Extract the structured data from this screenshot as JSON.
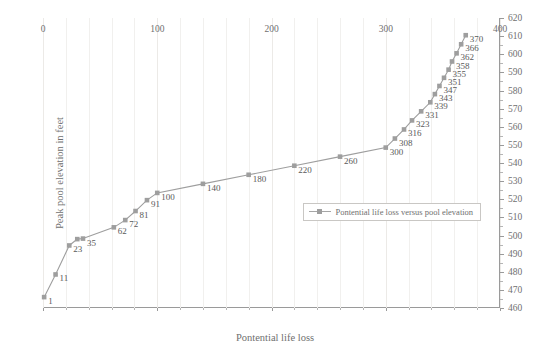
{
  "chart_data": {
    "type": "line",
    "title": "",
    "xlabel": "Pontential life loss",
    "ylabel": "Peak pool elevation in feet",
    "xlim": [
      0,
      400
    ],
    "ylim": [
      460,
      620
    ],
    "x_ticks": [
      0,
      100,
      200,
      300,
      400
    ],
    "y_ticks": [
      460,
      470,
      480,
      490,
      500,
      510,
      520,
      530,
      540,
      550,
      560,
      570,
      580,
      590,
      600,
      610,
      620
    ],
    "x_minor_step": 20,
    "y_minor_step": 5,
    "grid": "vertical",
    "y_axis_position": "right",
    "legend_position": "center-right",
    "series": [
      {
        "name": "Pontential life loss versus pool elevation",
        "color": "#9e9e9e",
        "marker": "square",
        "x": [
          1,
          11,
          23,
          30,
          35,
          62,
          72,
          81,
          91,
          100,
          140,
          180,
          220,
          260,
          300,
          308,
          316,
          323,
          331,
          339,
          343,
          347,
          351,
          355,
          358,
          362,
          366,
          370
        ],
        "y": [
          466.0,
          478.5,
          494.5,
          498.0,
          498.3,
          504.5,
          508.5,
          513.5,
          519.5,
          523.5,
          528.5,
          533.5,
          538.5,
          543.5,
          548.5,
          553.5,
          558.5,
          563.5,
          568.5,
          573.5,
          578.0,
          582.5,
          587.0,
          591.5,
          596.0,
          600.5,
          605.5,
          610.5
        ],
        "point_labels": [
          "1",
          "11",
          "23",
          "",
          "35",
          "62",
          "72",
          "81",
          "91",
          "100",
          "140",
          "180",
          "220",
          "260",
          "300",
          "308",
          "316",
          "323",
          "331",
          "339",
          "343",
          "347",
          "351",
          "355",
          "358",
          "362",
          "366",
          "370"
        ]
      }
    ]
  },
  "legend": {
    "entries": [
      {
        "label": "Pontential life loss versus pool elevation"
      }
    ]
  }
}
